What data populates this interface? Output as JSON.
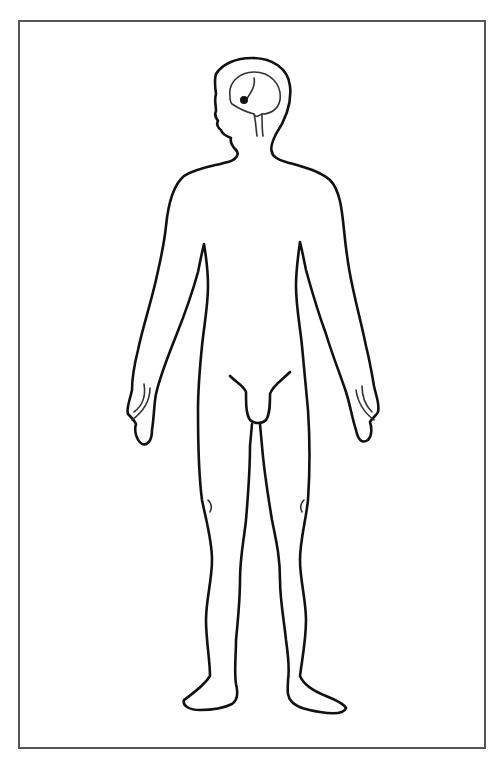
{
  "diagram": {
    "type": "anatomical-outline",
    "colors": {
      "stroke": "#111111",
      "frame": "#555555",
      "background": "#ffffff"
    },
    "parts": [
      "head",
      "brain",
      "brainstem",
      "torso",
      "left-arm",
      "right-arm",
      "left-hand",
      "right-hand",
      "groin",
      "left-leg",
      "right-leg",
      "left-foot",
      "right-foot"
    ]
  }
}
